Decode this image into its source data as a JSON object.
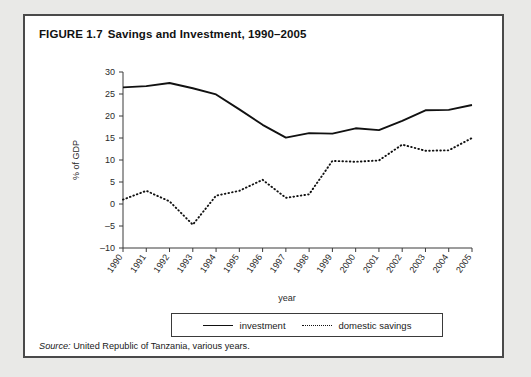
{
  "figure": {
    "number": "FIGURE 1.7",
    "title": "Savings and Investment, 1990–2005",
    "source_label": "Source:",
    "source_text": " United Republic of Tanzania, various years."
  },
  "legend": {
    "investment_label": "investment",
    "savings_label": "domestic savings"
  },
  "chart_data": {
    "type": "line",
    "title": "Savings and Investment, 1990–2005",
    "xlabel": "year",
    "ylabel": "% of GDP",
    "categories": [
      "1990",
      "1991",
      "1992",
      "1993",
      "1994",
      "1995",
      "1996",
      "1997",
      "1998",
      "1999",
      "2000",
      "2001",
      "2002",
      "2003",
      "2004",
      "2005"
    ],
    "x": [
      1990,
      1991,
      1992,
      1993,
      1994,
      1995,
      1996,
      1997,
      1998,
      1999,
      2000,
      2001,
      2002,
      2003,
      2004,
      2005
    ],
    "ylim": [
      -10,
      30
    ],
    "yticks": [
      -10,
      -5,
      0,
      5,
      10,
      15,
      20,
      25,
      30
    ],
    "grid": false,
    "legend_position": "bottom",
    "series": [
      {
        "name": "investment",
        "style": "solid",
        "color": "#111111",
        "values": [
          26.5,
          26.8,
          27.5,
          26.3,
          24.9,
          21.5,
          18.0,
          15.1,
          16.1,
          16.0,
          17.2,
          16.8,
          18.9,
          21.3,
          21.4,
          22.5
        ]
      },
      {
        "name": "domestic savings",
        "style": "dotted",
        "color": "#111111",
        "values": [
          1.0,
          3.0,
          0.6,
          -4.7,
          1.9,
          3.0,
          5.5,
          1.4,
          2.2,
          9.8,
          9.6,
          9.9,
          13.5,
          12.1,
          12.2,
          15.0
        ]
      }
    ]
  }
}
